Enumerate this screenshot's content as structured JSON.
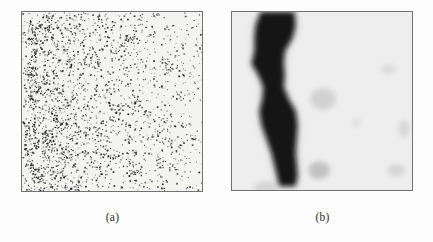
{
  "figure": {
    "background_color": "#fdfdfd",
    "panel_border_color": "#6f7275",
    "panels": [
      {
        "id": "a",
        "caption": "(a)",
        "kind": "binary-speckle-scatter",
        "description": "Dense random black dot field with a denser vertical band on the left side",
        "background_color": "#f3f3f2",
        "dot_color": "#1a1a1a",
        "x": 21,
        "y": 11,
        "width": 182,
        "height": 181
      },
      {
        "id": "b",
        "caption": "(b)",
        "kind": "smoothed-grayscale-blob",
        "description": "Blurred grayscale image showing a dark wavy vertical chromosome-like blob on the left plus faint gray smudges on the right",
        "background_color": "#eeeeee",
        "blob_color": "#0d0d0d",
        "x": 231,
        "y": 11,
        "width": 182,
        "height": 180
      }
    ]
  },
  "chart_data": {
    "type": "scatter",
    "title": "",
    "xlabel": "",
    "ylabel": "",
    "xlim": [
      0,
      182
    ],
    "ylim": [
      0,
      181
    ],
    "grid": false,
    "legend": null,
    "panel_a_point_count": 1850,
    "panel_a_density_profile": {
      "x_bins": [
        0,
        20,
        40,
        60,
        80,
        100,
        120,
        140,
        160,
        182
      ],
      "relative_density": [
        0.72,
        1.0,
        0.95,
        0.62,
        0.5,
        0.45,
        0.42,
        0.4,
        0.38,
        0.36
      ]
    },
    "panel_b_blob_spine": [
      {
        "x": 46,
        "y": 0,
        "w": 34
      },
      {
        "x": 44,
        "y": 14,
        "w": 40
      },
      {
        "x": 42,
        "y": 26,
        "w": 38
      },
      {
        "x": 38,
        "y": 40,
        "w": 30
      },
      {
        "x": 36,
        "y": 52,
        "w": 32
      },
      {
        "x": 40,
        "y": 64,
        "w": 26
      },
      {
        "x": 42,
        "y": 76,
        "w": 20
      },
      {
        "x": 44,
        "y": 88,
        "w": 26
      },
      {
        "x": 46,
        "y": 100,
        "w": 36
      },
      {
        "x": 48,
        "y": 114,
        "w": 36
      },
      {
        "x": 50,
        "y": 128,
        "w": 30
      },
      {
        "x": 52,
        "y": 142,
        "w": 24
      },
      {
        "x": 54,
        "y": 154,
        "w": 22
      },
      {
        "x": 56,
        "y": 166,
        "w": 20
      },
      {
        "x": 56,
        "y": 176,
        "w": 16
      }
    ],
    "panel_b_smudges": [
      {
        "x": 92,
        "y": 88,
        "rx": 13,
        "ry": 11,
        "opacity": 0.14
      },
      {
        "x": 88,
        "y": 160,
        "rx": 11,
        "ry": 9,
        "opacity": 0.22
      },
      {
        "x": 158,
        "y": 58,
        "rx": 8,
        "ry": 5,
        "opacity": 0.09
      },
      {
        "x": 174,
        "y": 118,
        "rx": 6,
        "ry": 9,
        "opacity": 0.11
      },
      {
        "x": 166,
        "y": 160,
        "rx": 9,
        "ry": 6,
        "opacity": 0.12
      },
      {
        "x": 126,
        "y": 112,
        "rx": 5,
        "ry": 4,
        "opacity": 0.07
      },
      {
        "x": 34,
        "y": 178,
        "rx": 12,
        "ry": 7,
        "opacity": 0.12
      }
    ]
  }
}
